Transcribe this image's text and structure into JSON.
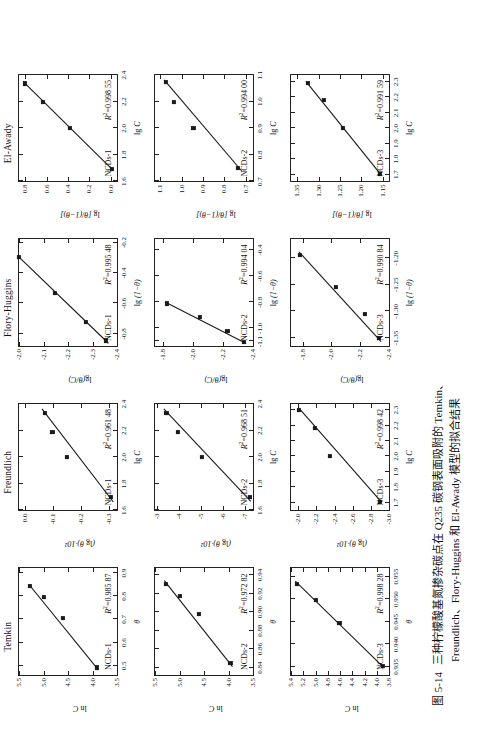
{
  "figure": {
    "caption_number": "图 5-14",
    "caption_line1": "三种柠檬酸基氮掺杂碳点在 Q235 碳钢表面吸附的 Temkin、",
    "caption_line2": "Freundlich、Flory-Huggins 和 El-Awady 模型的拟合结果"
  },
  "columns": [
    {
      "title": "Temkin"
    },
    {
      "title": "Freundlich"
    },
    {
      "title": "Flory-Huggins"
    },
    {
      "title": "El-Awady"
    }
  ],
  "axis_labels": {
    "lnC": "ln C",
    "lgTheta_x100": "(lg θ)·10²",
    "lgThetaOverC": "lg(θ/C)",
    "lgThetaOver1mTheta": "lg [θ/(1−θ)]",
    "theta": "θ",
    "lgC": "lg C",
    "lg1mTheta": "lg (1−θ)"
  },
  "series_names": [
    "NCDs-1",
    "NCDs-2",
    "NCDs-3"
  ],
  "chart_data": [
    {
      "id": "temkin-ncds1",
      "type": "scatter",
      "title": "Temkin",
      "series_label": "NCDs-1",
      "r2_label": "R²=0.985 87",
      "r2": 0.98587,
      "xlabel": "θ",
      "ylabel": "ln C",
      "xlim": [
        0.46,
        0.92
      ],
      "ylim": [
        3.5,
        5.5
      ],
      "xticks": [
        0.5,
        0.6,
        0.7,
        0.8,
        0.9
      ],
      "yticks": [
        3.5,
        4.0,
        4.5,
        5.0,
        5.5
      ],
      "xticklabels": [
        "0.5",
        "0.6",
        "0.7",
        "0.8",
        "0.9"
      ],
      "yticklabels": [
        "3.5",
        "4.0",
        "4.5",
        "5.0",
        "5.5"
      ],
      "x": [
        0.492,
        0.706,
        0.795,
        0.843
      ],
      "y": [
        3.91,
        4.61,
        4.99,
        5.28
      ],
      "fit_x": [
        0.482,
        0.852
      ],
      "fit_y": [
        3.88,
        5.3
      ]
    },
    {
      "id": "temkin-ncds2",
      "type": "scatter",
      "title": "Temkin",
      "series_label": "NCDs-2",
      "r2_label": "R²=0.972 82",
      "r2": 0.97282,
      "xlabel": "θ",
      "ylabel": "ln C",
      "xlim": [
        0.832,
        0.947
      ],
      "ylim": [
        3.5,
        5.5
      ],
      "xticks": [
        0.84,
        0.86,
        0.88,
        0.9,
        0.92,
        0.94
      ],
      "yticks": [
        3.5,
        4.0,
        4.5,
        5.0,
        5.5
      ],
      "xticklabels": [
        "0.84",
        "0.86",
        "0.88",
        "0.90",
        "0.92",
        "0.94"
      ],
      "yticklabels": [
        "3.5",
        "4.0",
        "4.5",
        "5.0",
        "5.5"
      ],
      "x": [
        0.845,
        0.898,
        0.917,
        0.93
      ],
      "y": [
        3.96,
        4.61,
        4.99,
        5.28
      ],
      "fit_x": [
        0.841,
        0.934
      ],
      "fit_y": [
        3.92,
        5.31
      ]
    },
    {
      "id": "temkin-ncds3",
      "type": "scatter",
      "title": "Temkin",
      "series_label": "NCDs-3",
      "r2_label": "R²=0.998 28",
      "r2": 0.99828,
      "xlabel": "θ",
      "ylabel": "ln C",
      "xlim": [
        0.9332,
        0.9568
      ],
      "ylim": [
        3.8,
        5.4
      ],
      "xticks": [
        0.935,
        0.94,
        0.945,
        0.95,
        0.955
      ],
      "yticks": [
        3.8,
        4.0,
        4.2,
        4.4,
        4.6,
        4.8,
        5.0,
        5.2,
        5.4
      ],
      "xticklabels": [
        "0.935",
        "0.940",
        "0.945",
        "0.950",
        "0.955"
      ],
      "yticklabels": [
        "3.8",
        "4.0",
        "4.2",
        "4.4",
        "4.6",
        "4.8",
        "5.0",
        "5.2",
        "5.4"
      ],
      "x": [
        0.9352,
        0.9447,
        0.9498,
        0.9534
      ],
      "y": [
        3.9,
        4.61,
        4.99,
        5.3
      ],
      "fit_x": [
        0.9348,
        0.954
      ],
      "fit_y": [
        3.88,
        5.33
      ]
    },
    {
      "id": "freundlich-ncds1",
      "type": "scatter",
      "title": "Freundlich",
      "series_label": "NCDs-1",
      "r2_label": "R²=0.961 48",
      "r2": 0.96148,
      "xlabel": "lg C",
      "ylabel": "(lg θ)·10²",
      "xlim": [
        1.6,
        2.4
      ],
      "ylim": [
        -0.33,
        0.02
      ],
      "xticks": [
        1.6,
        1.8,
        2.0,
        2.2,
        2.4
      ],
      "yticks": [
        0.0,
        -0.1,
        -0.2,
        -0.3
      ],
      "xticklabels": [
        "1.6",
        "1.8",
        "2.0",
        "2.2",
        "2.4"
      ],
      "yticklabels": [
        "0.0",
        "-0.1",
        "-0.2",
        "-0.3"
      ],
      "x": [
        1.7,
        2.0,
        2.19,
        2.33
      ],
      "y": [
        -0.309,
        -0.152,
        -0.099,
        -0.072
      ],
      "fit_x": [
        1.66,
        2.36
      ],
      "fit_y": [
        -0.317,
        -0.062
      ]
    },
    {
      "id": "freundlich-ncds2",
      "type": "scatter",
      "title": "Freundlich",
      "series_label": "NCDs-2",
      "r2_label": "R²=0.968 51",
      "r2": 0.96851,
      "xlabel": "lg C",
      "ylabel": "(lg θ)·10²",
      "xlim": [
        1.6,
        2.4
      ],
      "ylim": [
        -7.35,
        -2.9
      ],
      "xticks": [
        1.6,
        1.8,
        2.0,
        2.2,
        2.4
      ],
      "yticks": [
        -3,
        -4,
        -5,
        -6,
        -7
      ],
      "xticklabels": [
        "1.6",
        "1.8",
        "2.0",
        "2.2",
        "2.4"
      ],
      "yticklabels": [
        "-3",
        "-4",
        "-5",
        "-6",
        "-7"
      ],
      "x": [
        1.7,
        2.0,
        2.19,
        2.33
      ],
      "y": [
        -7.22,
        -5.03,
        -3.93,
        -3.42
      ],
      "fit_x": [
        1.665,
        2.36
      ],
      "fit_y": [
        -7.25,
        -3.3
      ]
    },
    {
      "id": "freundlich-ncds3",
      "type": "scatter",
      "title": "Freundlich",
      "series_label": "NCDs-3",
      "r2_label": "R²=0.998 42",
      "r2": 0.99842,
      "xlabel": "lg C",
      "ylabel": "(lg θ)·10²",
      "xlim": [
        1.65,
        2.34
      ],
      "ylim": [
        -3.0,
        -1.92
      ],
      "xticks": [
        1.7,
        1.8,
        1.9,
        2.0,
        2.1,
        2.2,
        2.3
      ],
      "yticks": [
        -2.0,
        -2.2,
        -2.4,
        -2.6,
        -2.8,
        -3.0
      ],
      "xticklabels": [
        "1.7",
        "1.8",
        "1.9",
        "2.0",
        "2.1",
        "2.2",
        "2.3"
      ],
      "yticklabels": [
        "-2.0",
        "-2.2",
        "-2.4",
        "-2.6",
        "-2.8",
        "-3.0"
      ],
      "x": [
        1.705,
        2.0,
        2.185,
        2.3
      ],
      "y": [
        -2.9,
        -2.35,
        -2.18,
        -2.01
      ],
      "fit_x": [
        1.7,
        2.315
      ],
      "fit_y": [
        -2.92,
        -2.0
      ]
    },
    {
      "id": "flory-ncds1",
      "type": "scatter",
      "title": "Flory-Huggins",
      "series_label": "NCDs-1",
      "r2_label": "R²=0.995 48",
      "r2": 0.99548,
      "xlabel": "lg (1−θ)",
      "ylabel": "lg(θ/C)",
      "xlim": [
        -0.88,
        -0.18
      ],
      "ylim": [
        -2.4,
        -2.0
      ],
      "xticks": [
        -0.2,
        -0.4,
        -0.6,
        -0.8
      ],
      "yticks": [
        -2.0,
        -2.1,
        -2.2,
        -2.3,
        -2.4
      ],
      "xticklabels": [
        "-0.2",
        "-0.4",
        "-0.6",
        "-0.8"
      ],
      "yticklabels": [
        "-2.0",
        "-2.1",
        "-2.2",
        "-2.3",
        "-2.4"
      ],
      "x": [
        -0.845,
        -0.723,
        -0.531,
        -0.295
      ],
      "y": [
        -2.355,
        -2.272,
        -2.145,
        -1.998
      ],
      "fit_x": [
        -0.862,
        -0.287
      ],
      "fit_y": [
        -2.365,
        -1.995
      ]
    },
    {
      "id": "flory-ncds2",
      "type": "scatter",
      "title": "Flory-Huggins",
      "series_label": "NCDs-2",
      "r2_label": "R²=0.994 04",
      "r2": 0.99404,
      "xlabel": "lg (1−θ)",
      "ylabel": "lg(θ/C)",
      "xlim": [
        -1.135,
        -0.32
      ],
      "ylim": [
        -2.4,
        -1.75
      ],
      "xticks": [
        -0.4,
        -0.6,
        -0.8,
        -1.0,
        -1.1
      ],
      "yticks": [
        -1.8,
        -2.0,
        -2.2,
        -2.4
      ],
      "xticklabels": [
        "-0.4",
        "-0.6",
        "-0.8",
        "-1.0",
        "-1.1"
      ],
      "yticklabels": [
        "-1.8",
        "-2.0",
        "-2.2",
        "-2.4"
      ],
      "x": [
        -1.105,
        -1.02,
        -0.915,
        -0.81
      ],
      "y": [
        -2.34,
        -2.23,
        -2.05,
        -1.83
      ],
      "fit_x": [
        -1.115,
        -0.8
      ],
      "fit_y": [
        -2.355,
        -1.82
      ]
    },
    {
      "id": "flory-ncds3",
      "type": "scatter",
      "title": "Flory-Huggins",
      "series_label": "NCDs-3",
      "r2_label": "R²=0.990 84",
      "r2": 0.99084,
      "xlabel": "lg (1−θ)",
      "ylabel": "lg(θ/C)",
      "xlim": [
        -1.365,
        -1.165
      ],
      "ylim": [
        -2.4,
        -1.72
      ],
      "xticks": [
        -1.2,
        -1.25,
        -1.3,
        -1.35
      ],
      "yticks": [
        -1.8,
        -2.0,
        -2.2,
        -2.4
      ],
      "xticklabels": [
        "-1.20",
        "-1.25",
        "-1.30",
        "-1.35"
      ],
      "yticklabels": [
        "-1.8",
        "-2.0",
        "-2.2",
        "-2.4"
      ],
      "x": [
        -1.35,
        -1.305,
        -1.255,
        -1.195
      ],
      "y": [
        -2.33,
        -2.23,
        -2.03,
        -1.78
      ],
      "fit_x": [
        -1.357,
        -1.188
      ],
      "fit_y": [
        -2.345,
        -1.775
      ]
    },
    {
      "id": "elawady-ncds1",
      "type": "scatter",
      "title": "El-Awady",
      "series_label": "NCDs-1",
      "r2_label": "R²=0.998 55",
      "r2": 0.99855,
      "xlabel": "lg C",
      "ylabel": "lg [θ/(1−θ)]",
      "xlim": [
        1.6,
        2.4
      ],
      "ylim": [
        -0.06,
        0.86
      ],
      "xticks": [
        1.6,
        1.8,
        2.0,
        2.2,
        2.4
      ],
      "yticks": [
        0.0,
        0.2,
        0.4,
        0.6,
        0.8
      ],
      "xticklabels": [
        "1.6",
        "1.8",
        "2.0",
        "2.2",
        "2.4"
      ],
      "yticklabels": [
        "0.0",
        "0.2",
        "0.4",
        "0.6",
        "0.8"
      ],
      "x": [
        1.695,
        2.0,
        2.195,
        2.335
      ],
      "y": [
        -0.012,
        0.385,
        0.635,
        0.805
      ],
      "fit_x": [
        1.682,
        2.345
      ],
      "fit_y": [
        -0.022,
        0.818
      ]
    },
    {
      "id": "elawady-ncds2",
      "type": "scatter",
      "title": "El-Awady",
      "series_label": "NCDs-2",
      "r2_label": "R²=0.994 00",
      "r2": 0.994,
      "xlabel": "lg C",
      "ylabel": "lg [θ/(1−θ)]",
      "xlim": [
        1.6,
        2.4
      ],
      "ylim": [
        0.665,
        1.125
      ],
      "xticks": [
        1.6,
        1.8,
        2.0,
        2.2,
        2.4
      ],
      "yticks": [
        0.7,
        0.8,
        0.9,
        1.0,
        1.1
      ],
      "xticklabels": [
        "0.7",
        "0.8",
        "0.9",
        "1.0",
        "1.1"
      ],
      "yticklabels": [
        "0.7",
        "0.8",
        "0.9",
        "1.0",
        "1.1"
      ],
      "x": [
        1.7,
        2.0,
        2.195,
        2.345
      ],
      "y": [
        0.735,
        0.945,
        1.035,
        1.075
      ],
      "fit_x": [
        1.675,
        2.36
      ],
      "fit_y": [
        0.718,
        1.082
      ]
    },
    {
      "id": "elawady-ncds3",
      "type": "scatter",
      "title": "El-Awady",
      "series_label": "NCDs-3",
      "r2_label": "R²=0.991 59",
      "r2": 0.99159,
      "xlabel": "lg C",
      "ylabel": "lg [θ/(1−θ)]",
      "xlim": [
        1.655,
        2.345
      ],
      "ylim": [
        1.135,
        1.365
      ],
      "xticks": [
        1.7,
        1.8,
        1.9,
        2.0,
        2.1,
        2.2,
        2.3
      ],
      "yticks": [
        1.15,
        1.2,
        1.25,
        1.3,
        1.35
      ],
      "xticklabels": [
        "1.7",
        "1.8",
        "1.9",
        "2.0",
        "2.1",
        "2.2",
        "2.3"
      ],
      "yticklabels": [
        "1.15",
        "1.20",
        "1.25",
        "1.30",
        "1.35"
      ],
      "x": [
        1.705,
        2.0,
        2.185,
        2.29
      ],
      "y": [
        1.157,
        1.243,
        1.288,
        1.325
      ],
      "fit_x": [
        1.7,
        2.3
      ],
      "fit_y": [
        1.155,
        1.33
      ]
    }
  ]
}
